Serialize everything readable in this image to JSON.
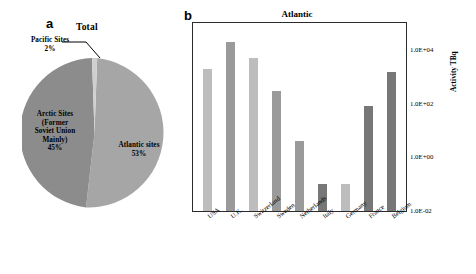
{
  "figure": {
    "panel_a_letter": "a",
    "panel_b_letter": "b"
  },
  "colors": {
    "arctic_slice": "#8c8c8c",
    "atlantic_slice": "#a6a6a6",
    "pacific_slice": "#cfcfcf",
    "bar_light": "#bdbdbd",
    "bar_medium": "#9a9a9a",
    "bar_dark": "#777777",
    "axis": "#2b2b2b"
  },
  "pie": {
    "title": "Total",
    "slices": [
      {
        "label": "Pacific Sites",
        "value_label": "2%",
        "value": 2,
        "color": "#cfcfcf"
      },
      {
        "label": "Atlantic sites",
        "value_label": "53%",
        "value": 53,
        "color": "#a6a6a6"
      },
      {
        "label": "Arctic Sites (Former Soviet Union Mainly)",
        "value_label": "45%",
        "value": 45,
        "color": "#8c8c8c"
      }
    ],
    "pacific_label_line1": "Pacific Sites",
    "pacific_label_line2": "2%",
    "arctic_label_line1": "Arctic Sites",
    "arctic_label_line2": "(Former",
    "arctic_label_line3": "Soviet Union",
    "arctic_label_line4": "Mainly)",
    "arctic_label_line5": "45%",
    "atlantic_label_line1": "Atlantic sites",
    "atlantic_label_line2": "53%"
  },
  "chart_data": [
    {
      "type": "pie",
      "title": "Total",
      "categories": [
        "Pacific Sites",
        "Atlantic sites",
        "Arctic Sites (Former Soviet Union Mainly)"
      ],
      "values": [
        2,
        53,
        45
      ],
      "value_labels": [
        "2%",
        "53%",
        "45%"
      ],
      "legend": "none",
      "annotations": [
        "Pacific Sites 2%",
        "Atlantic sites 53%",
        "Arctic Sites (Former Soviet Union Mainly) 45%"
      ]
    },
    {
      "type": "bar",
      "title": "Atlantic",
      "categories": [
        "USA",
        "U.K.",
        "Switzerland",
        "Sweden",
        "Netherlands",
        "Italy",
        "Germany",
        "France",
        "Belgium"
      ],
      "values": [
        2000,
        20000,
        5000,
        300,
        4,
        0.1,
        0.1,
        80,
        1500
      ],
      "xlabel": "",
      "ylabel": "Activity TBq",
      "yscale": "log",
      "ylim": [
        0.01,
        100000
      ],
      "ytick_labels": [
        "1.0E+04",
        "1.0E+02",
        "1.0E+00",
        "1.0E-02"
      ],
      "ytick_values": [
        10000,
        100,
        1,
        0.01
      ],
      "grid": false,
      "legend": "none",
      "bar_colors": [
        "#bdbdbd",
        "#9a9a9a",
        "#bdbdbd",
        "#9a9a9a",
        "#9a9a9a",
        "#777777",
        "#bdbdbd",
        "#777777",
        "#777777"
      ]
    }
  ]
}
